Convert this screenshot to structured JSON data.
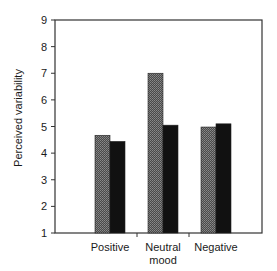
{
  "chart_data": {
    "type": "bar",
    "title": "",
    "xlabel": "",
    "ylabel": "Perceived variability",
    "ylim": [
      1,
      9
    ],
    "yticks": [
      1,
      2,
      3,
      4,
      5,
      6,
      7,
      8,
      9
    ],
    "categories": [
      "Positive",
      "Neutral mood",
      "Negative"
    ],
    "category_lines": [
      [
        "Positive"
      ],
      [
        "Neutral",
        "mood"
      ],
      [
        "Negative"
      ]
    ],
    "series": [
      {
        "name": "Series 1 (stippled gray)",
        "pattern": "stipple",
        "color": "#5a5a5a",
        "values": [
          4.67,
          7.0,
          4.98
        ]
      },
      {
        "name": "Series 2 (solid black)",
        "pattern": "solid",
        "color": "#111111",
        "values": [
          4.44,
          5.05,
          5.1
        ]
      }
    ],
    "grid": false,
    "legend": null
  }
}
